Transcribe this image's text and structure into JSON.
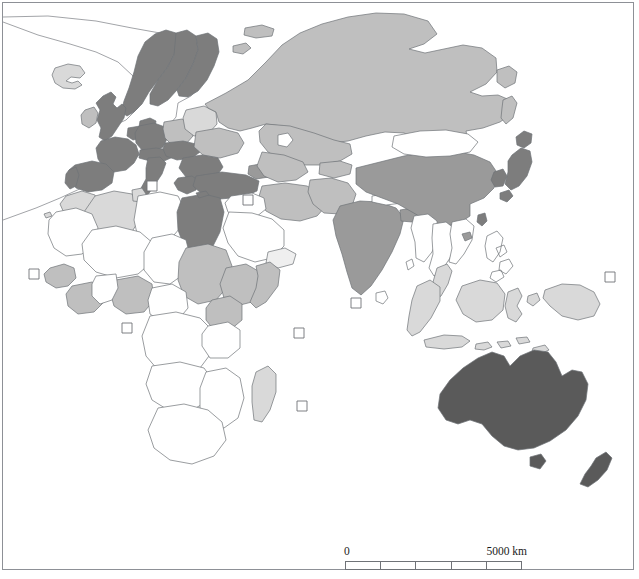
{
  "figure": {
    "type": "choropleth-map",
    "region": "Eastern Hemisphere",
    "projection_note": "world map centered on Africa, Eurasia, Australia"
  },
  "scale": {
    "left_label": "0",
    "right_label": "5000 km",
    "segments": 5,
    "total_km": 5000,
    "segment_km": 1000
  },
  "shading": {
    "none": "#ffffff",
    "very_light": "#efefef",
    "light": "#d9d9d9",
    "medium": "#bfbfbf",
    "medium_dark": "#9a9a9a",
    "dark": "#7d7d7d",
    "very_dark": "#5a5a5a",
    "outline": "#6f7277"
  },
  "map_data": {
    "categories": [
      {
        "key": "none",
        "fill": "#ffffff"
      },
      {
        "key": "very_light",
        "fill": "#efefef"
      },
      {
        "key": "light",
        "fill": "#d9d9d9"
      },
      {
        "key": "medium",
        "fill": "#bfbfbf"
      },
      {
        "key": "medium_dark",
        "fill": "#9a9a9a"
      },
      {
        "key": "dark",
        "fill": "#7d7d7d"
      },
      {
        "key": "very_dark",
        "fill": "#5a5a5a"
      }
    ],
    "regions": [
      {
        "name": "Greenland",
        "class": "none"
      },
      {
        "name": "Iceland",
        "class": "light"
      },
      {
        "name": "Norway",
        "class": "dark"
      },
      {
        "name": "Sweden",
        "class": "dark"
      },
      {
        "name": "Finland",
        "class": "dark"
      },
      {
        "name": "United Kingdom",
        "class": "dark"
      },
      {
        "name": "Ireland",
        "class": "medium"
      },
      {
        "name": "France",
        "class": "dark"
      },
      {
        "name": "Spain",
        "class": "dark"
      },
      {
        "name": "Portugal",
        "class": "dark"
      },
      {
        "name": "Germany",
        "class": "dark"
      },
      {
        "name": "Poland",
        "class": "medium"
      },
      {
        "name": "Italy",
        "class": "dark"
      },
      {
        "name": "Austria",
        "class": "dark"
      },
      {
        "name": "Belarus",
        "class": "light"
      },
      {
        "name": "Ukraine",
        "class": "medium"
      },
      {
        "name": "Romania",
        "class": "dark"
      },
      {
        "name": "Balkans",
        "class": "dark"
      },
      {
        "name": "Greece",
        "class": "dark"
      },
      {
        "name": "Turkey",
        "class": "dark"
      },
      {
        "name": "Russia",
        "class": "medium"
      },
      {
        "name": "Kazakhstan",
        "class": "medium"
      },
      {
        "name": "Mongolia",
        "class": "none"
      },
      {
        "name": "China",
        "class": "medium_dark"
      },
      {
        "name": "Japan",
        "class": "dark"
      },
      {
        "name": "Korea",
        "class": "dark"
      },
      {
        "name": "India",
        "class": "medium_dark"
      },
      {
        "name": "Iran",
        "class": "medium"
      },
      {
        "name": "Saudi Arabia",
        "class": "none"
      },
      {
        "name": "Egypt",
        "class": "dark"
      },
      {
        "name": "Libya",
        "class": "light"
      },
      {
        "name": "Algeria",
        "class": "light"
      },
      {
        "name": "Morocco",
        "class": "light"
      },
      {
        "name": "Sudan",
        "class": "medium"
      },
      {
        "name": "Ethiopia",
        "class": "medium"
      },
      {
        "name": "Kenya",
        "class": "medium"
      },
      {
        "name": "Nigeria",
        "class": "medium"
      },
      {
        "name": "Ghana",
        "class": "medium"
      },
      {
        "name": "Madagascar",
        "class": "light"
      },
      {
        "name": "Southern Africa",
        "class": "none"
      },
      {
        "name": "Central Africa",
        "class": "none"
      },
      {
        "name": "Indonesia",
        "class": "light"
      },
      {
        "name": "Malaysia",
        "class": "light"
      },
      {
        "name": "Philippines",
        "class": "none"
      },
      {
        "name": "Thailand",
        "class": "none"
      },
      {
        "name": "Myanmar",
        "class": "none"
      },
      {
        "name": "Papua New Guinea",
        "class": "light"
      },
      {
        "name": "Australia",
        "class": "very_dark"
      },
      {
        "name": "New Zealand",
        "class": "very_dark"
      },
      {
        "name": "Tasmania",
        "class": "very_dark"
      }
    ],
    "island_markers": [
      {
        "name": "island-marker-atlantic-west",
        "x": 34,
        "y": 274
      },
      {
        "name": "island-marker-cyprus",
        "x": 152,
        "y": 186
      },
      {
        "name": "island-marker-mediterranean",
        "x": 248,
        "y": 200
      },
      {
        "name": "island-marker-cape-verde",
        "x": 127,
        "y": 328
      },
      {
        "name": "island-marker-gulf-guinea",
        "x": 299,
        "y": 333
      },
      {
        "name": "island-marker-maldives",
        "x": 356,
        "y": 303
      },
      {
        "name": "island-marker-seychelles",
        "x": 302,
        "y": 406
      },
      {
        "name": "island-marker-pacific-east",
        "x": 610,
        "y": 277
      }
    ]
  }
}
